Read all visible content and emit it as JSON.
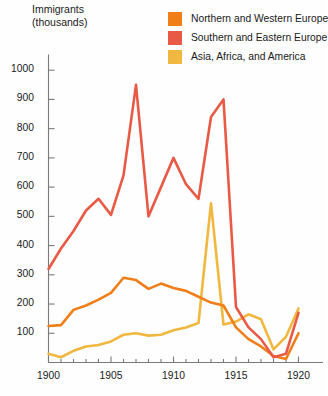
{
  "chart_data": {
    "type": "line",
    "title": "",
    "ylabel": "Immigrants\n(thousands)",
    "ylabel_line1": "Immigrants",
    "ylabel_line2": "(thousands)",
    "xlabel": "",
    "xlim": [
      1900,
      1921
    ],
    "ylim": [
      0,
      1040
    ],
    "grid": false,
    "legend_position": "top-right",
    "yticks": [
      100,
      200,
      300,
      400,
      500,
      600,
      700,
      800,
      900,
      1000
    ],
    "ytick_labels": [
      "100",
      "200",
      "300",
      "400",
      "500",
      "600",
      "700",
      "800",
      "900",
      "1000"
    ],
    "xticks": [
      1900,
      1905,
      1910,
      1915,
      1920
    ],
    "xtick_labels": [
      "1900",
      "1905",
      "1910",
      "1915",
      "1920"
    ],
    "x": [
      1900,
      1901,
      1902,
      1903,
      1904,
      1905,
      1906,
      1907,
      1908,
      1909,
      1910,
      1911,
      1912,
      1913,
      1914,
      1915,
      1916,
      1917,
      1918,
      1919,
      1920
    ],
    "series": [
      {
        "name": "Northern and Western Europe",
        "color": "#F07F1A",
        "values": [
          125,
          128,
          180,
          195,
          215,
          238,
          290,
          282,
          252,
          270,
          255,
          245,
          225,
          205,
          195,
          120,
          80,
          55,
          22,
          12,
          100
        ]
      },
      {
        "name": "Southern and Eastern Europe",
        "color": "#E85A45",
        "values": [
          320,
          390,
          450,
          520,
          560,
          505,
          640,
          950,
          500,
          600,
          700,
          610,
          560,
          840,
          900,
          190,
          120,
          80,
          18,
          30,
          170
        ]
      },
      {
        "name": "Asia, Africa, and America",
        "color": "#F0B840",
        "values": [
          30,
          18,
          40,
          55,
          60,
          72,
          95,
          100,
          92,
          95,
          110,
          120,
          135,
          545,
          130,
          140,
          165,
          148,
          45,
          88,
          185
        ]
      }
    ]
  },
  "legend": {
    "items": [
      {
        "label": "Northern and Western Europe",
        "color": "#F07F1A"
      },
      {
        "label": "Southern and Eastern Europe",
        "color": "#E85A45"
      },
      {
        "label": "Asia, Africa, and America",
        "color": "#F0B840"
      }
    ]
  },
  "axes": {
    "y_title_line1": "Immigrants",
    "y_title_line2": "(thousands)",
    "axis_color": "#7a7a7a"
  }
}
